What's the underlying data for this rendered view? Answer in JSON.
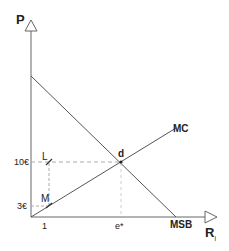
{
  "diagram": {
    "axes": {
      "y_label": "P",
      "x_label": "R",
      "x_label_sub": "i"
    },
    "curves": {
      "mc_label": "MC",
      "msb_label": "MSB"
    },
    "points": {
      "equilibrium": "d",
      "l": "L",
      "m": "M"
    },
    "ticks": {
      "y_high": "10€",
      "y_low": "3€",
      "x_one": "1",
      "x_star": "e*"
    },
    "colors": {
      "line": "#555555",
      "dash": "#aaaaaa",
      "text": "#222222"
    }
  }
}
